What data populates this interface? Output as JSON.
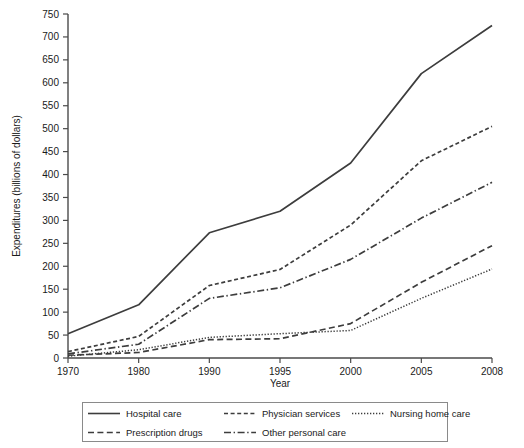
{
  "chart_data": {
    "type": "line",
    "title": "",
    "xlabel": "Year",
    "ylabel": "Expenditures (billions of dollars)",
    "categories": [
      "1970",
      "1980",
      "1990",
      "1995",
      "2000",
      "2005",
      "2008"
    ],
    "x_tick_labels": [
      "1970",
      "1980",
      "1990",
      "1995",
      "2000",
      "2005",
      "2008"
    ],
    "y_tick_labels": [
      "0",
      "50",
      "100",
      "150",
      "200",
      "250",
      "300",
      "350",
      "400",
      "450",
      "500",
      "550",
      "600",
      "650",
      "700",
      "750"
    ],
    "y_ticks": [
      0,
      50,
      100,
      150,
      200,
      250,
      300,
      350,
      400,
      450,
      500,
      550,
      600,
      650,
      700,
      750
    ],
    "ylim": [
      0,
      750
    ],
    "grid": false,
    "legend_position": "below",
    "series": [
      {
        "name": "Hospital care",
        "style": "solid",
        "color": "#3d3d3d",
        "values": [
          53,
          116,
          273,
          320,
          425,
          620,
          725
        ]
      },
      {
        "name": "Physician services",
        "style": "dashed-fine",
        "color": "#3d3d3d",
        "values": [
          14,
          47,
          158,
          193,
          290,
          430,
          505
        ]
      },
      {
        "name": "Nursing home care",
        "style": "dotted",
        "color": "#3d3d3d",
        "values": [
          4,
          18,
          45,
          53,
          60,
          130,
          194
        ]
      },
      {
        "name": "Prescription drugs",
        "style": "dashed-long",
        "color": "#3d3d3d",
        "values": [
          6,
          12,
          40,
          42,
          75,
          165,
          245
        ]
      },
      {
        "name": "Other personal care",
        "style": "dash-dot",
        "color": "#3d3d3d",
        "values": [
          9,
          30,
          130,
          153,
          215,
          305,
          383
        ]
      }
    ]
  },
  "legend": {
    "entries": [
      {
        "label": "Hospital care"
      },
      {
        "label": "Physician services"
      },
      {
        "label": "Nursing home care"
      },
      {
        "label": "Prescription drugs"
      },
      {
        "label": "Other personal care"
      }
    ]
  }
}
